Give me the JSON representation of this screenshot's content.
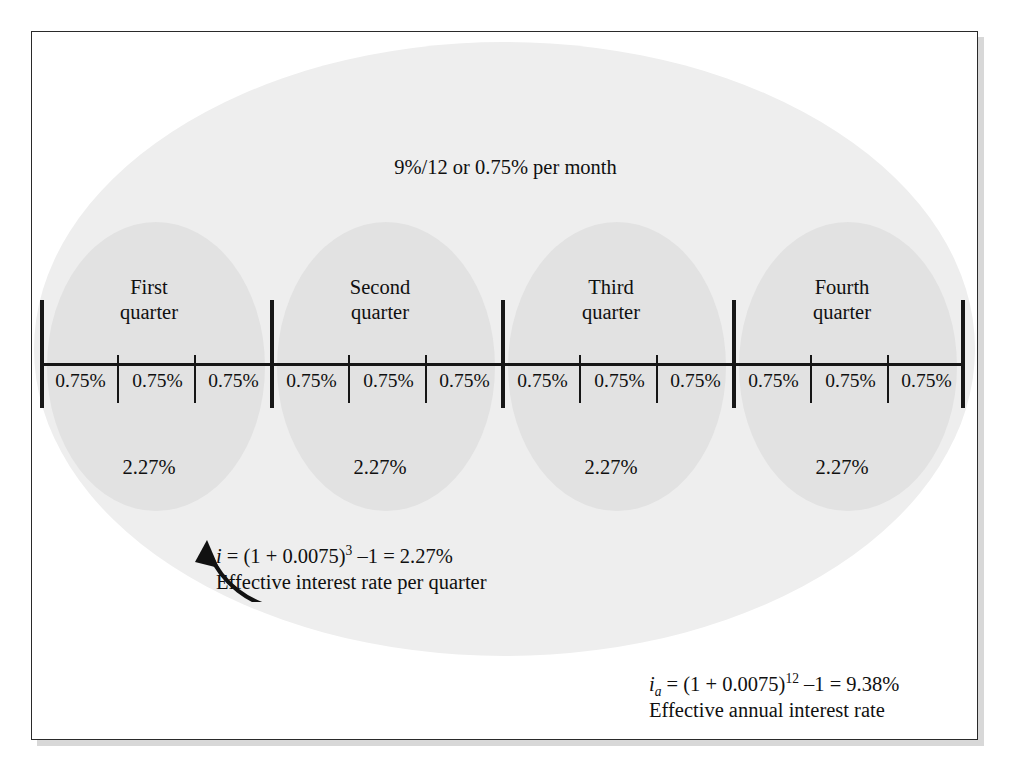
{
  "figure": {
    "header_note": "9%/12 or 0.75% per month",
    "nominal_rate": "9%",
    "periods_per_year": "12",
    "monthly_rate": "0.75%",
    "quarters": [
      {
        "name_line1": "First",
        "name_line2": "quarter",
        "rate": "2.27%",
        "months": [
          "0.75%",
          "0.75%",
          "0.75%"
        ]
      },
      {
        "name_line1": "Second",
        "name_line2": "quarter",
        "rate": "2.27%",
        "months": [
          "0.75%",
          "0.75%",
          "0.75%"
        ]
      },
      {
        "name_line1": "Third",
        "name_line2": "quarter",
        "rate": "2.27%",
        "months": [
          "0.75%",
          "0.75%",
          "0.75%"
        ]
      },
      {
        "name_line1": "Fourth",
        "name_line2": "quarter",
        "rate": "2.27%",
        "months": [
          "0.75%",
          "0.75%",
          "0.75%"
        ]
      }
    ],
    "quarter_annotation": {
      "symbol": "i",
      "formula": " = (1 + 0.0075)",
      "exponent": "3",
      "formula_tail": " –1 = 2.27%",
      "caption": "Effective interest rate per quarter"
    },
    "annual_annotation": {
      "symbol": "i",
      "subscript": "a",
      "formula": " = (1 + 0.0075)",
      "exponent": "12",
      "formula_tail": " –1 = 9.38%",
      "caption": "Effective annual interest rate"
    },
    "colors": {
      "outer_ellipse": "#eeeeee",
      "quarter_ellipse": "#e2e2e2",
      "line": "#161616",
      "frame": "#2a2a2a",
      "background": "#ffffff"
    },
    "icons": {
      "callout_arrow": "curved-arrow-icon"
    }
  }
}
